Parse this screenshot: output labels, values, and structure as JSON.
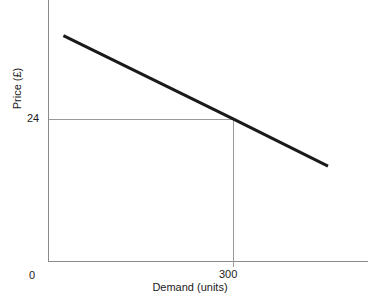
{
  "chart_data": {
    "type": "line",
    "title": "",
    "subtitle": "",
    "xlabel": "Demand (units)",
    "ylabel": "Price (£)",
    "xlim": [
      0,
      520
    ],
    "ylim": [
      0,
      44
    ],
    "grid": false,
    "legend": null,
    "x_ticks": [
      {
        "value": 0,
        "label": "0"
      },
      {
        "value": 300,
        "label": "300"
      }
    ],
    "y_ticks": [
      {
        "value": 24,
        "label": "24"
      }
    ],
    "series": [
      {
        "name": "Demand curve",
        "type": "line",
        "color": "#1a1a1a",
        "width": 3,
        "x": [
          25,
          300,
          455
        ],
        "y": [
          38,
          24,
          16
        ],
        "points": [
          {
            "x": 25,
            "y": 38
          },
          {
            "x": 300,
            "y": 24
          },
          {
            "x": 455,
            "y": 16
          }
        ]
      }
    ],
    "annotations": [
      {
        "name": "price-quantity-guide",
        "type": "guide-lines",
        "x": 300,
        "y": 24,
        "x_label": "300",
        "y_label": "24",
        "color": "#9a9a9a",
        "description": "Dashed-free thin guide lines from the price axis at 24 across to the demand curve, then down to 300 on the demand axis"
      }
    ],
    "axis_color": "#8a8a8a",
    "background": "#ffffff"
  },
  "axes": {
    "y_title": "Price (£)",
    "x_title": "Demand (units)",
    "origin_label": "0",
    "y_tick_24": "24",
    "x_tick_300": "300"
  },
  "caption": {
    "sliver_text": ""
  }
}
